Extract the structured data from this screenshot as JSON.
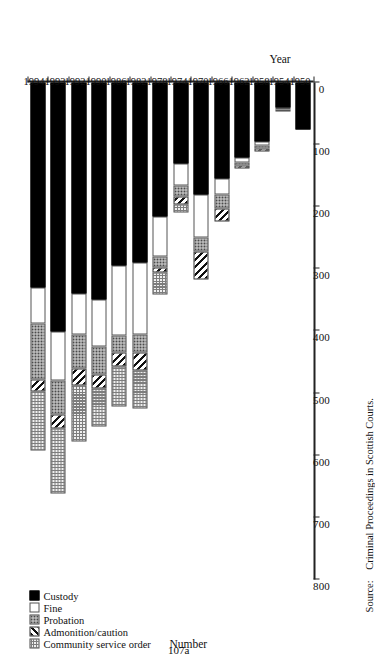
{
  "figure": {
    "folio": "107a",
    "source_label": "Source:",
    "source_text": "Criminal Proceedings in Scottish Courts."
  },
  "chart_data": {
    "type": "bar",
    "orientation": "horizontal-stacked",
    "title": "",
    "xlabel": "Number",
    "ylabel": "Year",
    "xlim": [
      0,
      800
    ],
    "xticks": [
      800,
      700,
      600,
      500,
      400,
      300,
      200,
      100,
      0
    ],
    "xtick_labels": [
      "800",
      "700",
      "600",
      "500",
      "400",
      "300",
      "200",
      "100",
      "0"
    ],
    "axis_direction": "value axis decreases left to right; bars extend from 0 at right",
    "grid": false,
    "legend_position": "bottom-left",
    "categories": [
      "1994",
      "1993",
      "1992",
      "1990",
      "1986",
      "1982",
      "1978",
      "1974",
      "1970",
      "1966",
      "1962",
      "1958",
      "1954",
      "1950"
    ],
    "series": [
      {
        "name": "Custody",
        "key": "custody",
        "color": "#000000",
        "pattern": "solid-black",
        "values": [
          330,
          400,
          340,
          350,
          295,
          290,
          215,
          130,
          180,
          155,
          120,
          95,
          40,
          75
        ]
      },
      {
        "name": "Fine",
        "key": "fine",
        "color": "#ffffff",
        "pattern": "open-white",
        "values": [
          58,
          80,
          65,
          75,
          112,
          115,
          65,
          35,
          70,
          25,
          8,
          6,
          4,
          0
        ]
      },
      {
        "name": "Probation",
        "key": "probation",
        "color": "#d8d8d8",
        "pattern": "fine-dotted",
        "values": [
          90,
          55,
          55,
          45,
          28,
          30,
          18,
          18,
          22,
          22,
          6,
          6,
          3,
          0
        ]
      },
      {
        "name": "Admonition/caution",
        "key": "admonition",
        "color": "#111111",
        "pattern": "diagonal-hatch",
        "values": [
          20,
          22,
          28,
          22,
          22,
          28,
          8,
          14,
          45,
          22,
          4,
          4,
          0,
          0
        ]
      },
      {
        "name": "Community service order",
        "key": "cso",
        "color": "#efefef",
        "pattern": "cross-hatch-grid",
        "values": [
          95,
          105,
          90,
          62,
          65,
          62,
          35,
          12,
          0,
          0,
          0,
          0,
          0,
          0
        ]
      }
    ],
    "totals": [
      593,
      662,
      578,
      554,
      522,
      525,
      341,
      209,
      317,
      224,
      138,
      111,
      47,
      75
    ]
  }
}
